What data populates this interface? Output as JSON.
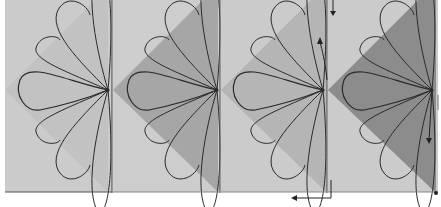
{
  "diagram": {
    "colors": {
      "block_bg": "#c9c9c9",
      "panel_bg": "#cdcdcd",
      "triangle_light": "#b8b8b8",
      "triangle_medium": "#a8a8a8",
      "triangle_dark": "#8a8a8a",
      "line": "#2a2a2a",
      "divider": "#555555"
    },
    "panels": [
      {
        "index": 1,
        "shade": "light",
        "label": "step-1"
      },
      {
        "index": 2,
        "shade": "medium",
        "label": "step-2"
      },
      {
        "index": 3,
        "shade": "medium-light",
        "label": "step-3"
      },
      {
        "index": 4,
        "shade": "dark",
        "label": "step-4"
      }
    ],
    "arrows": [
      {
        "name": "top-down-arrow",
        "direction": "down"
      },
      {
        "name": "stitch-up-arrow",
        "direction": "up"
      },
      {
        "name": "bottom-left-arrow",
        "direction": "left"
      },
      {
        "name": "right-down-arrow",
        "direction": "down"
      }
    ]
  }
}
